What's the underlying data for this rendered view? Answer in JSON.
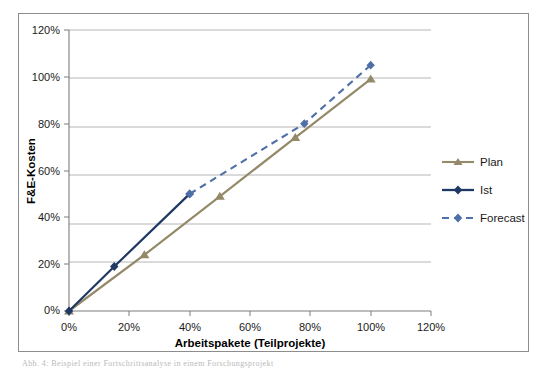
{
  "figure": {
    "caption": "Abb. 4: Beispiel einer Fortschrittsanalyse in einem Forschungsprojekt",
    "border_color": "#8d8d8d"
  },
  "chart_data": {
    "type": "line",
    "title": "",
    "subtitle": "",
    "xlabel": "Arbeitspakete (Teilprojekte)",
    "ylabel": "F&E-Kosten",
    "xlim": [
      0,
      120
    ],
    "ylim": [
      0,
      120
    ],
    "xticks": [
      0,
      20,
      40,
      60,
      80,
      100,
      120
    ],
    "yticks": [
      0,
      20,
      40,
      60,
      80,
      100,
      120
    ],
    "xtick_labels": [
      "0%",
      "20%",
      "40%",
      "60%",
      "80%",
      "100%",
      "120%"
    ],
    "ytick_labels": [
      "0%",
      "20%",
      "40%",
      "60%",
      "80%",
      "100%",
      "120%"
    ],
    "grid": "horizontal",
    "legend_position": "right",
    "series": [
      {
        "name": "Plan",
        "color": "#948a6a",
        "marker": "triangle",
        "dash": "solid",
        "points": [
          {
            "x": 0,
            "y": 0
          },
          {
            "x": 25,
            "y": 24
          },
          {
            "x": 50,
            "y": 49
          },
          {
            "x": 75,
            "y": 74
          },
          {
            "x": 100,
            "y": 99
          }
        ]
      },
      {
        "name": "Ist",
        "color": "#1f3864",
        "marker": "diamond",
        "dash": "solid",
        "points": [
          {
            "x": 0,
            "y": 0
          },
          {
            "x": 15,
            "y": 19
          },
          {
            "x": 40,
            "y": 50
          }
        ]
      },
      {
        "name": "Forecast",
        "color": "#4f6fa8",
        "marker": "diamond",
        "dash": "dashed",
        "points": [
          {
            "x": 40,
            "y": 50
          },
          {
            "x": 78,
            "y": 80
          },
          {
            "x": 100,
            "y": 105
          }
        ]
      }
    ]
  },
  "legend": {
    "items": [
      {
        "label": "Plan"
      },
      {
        "label": "Ist"
      },
      {
        "label": "Forecast"
      }
    ]
  }
}
